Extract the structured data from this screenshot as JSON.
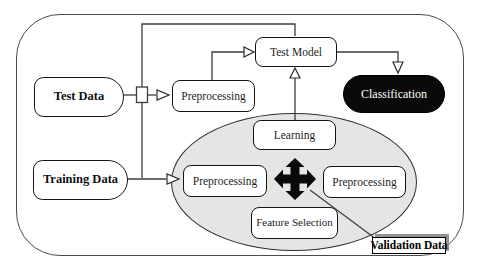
{
  "diagram": {
    "nodes": {
      "test_data": "Test Data",
      "training_data": "Training Data",
      "preprocessing_top": "Preprocessing",
      "test_model": "Test Model",
      "classification": "Classification",
      "learning": "Learning",
      "preprocessing_left": "Preprocessing",
      "preprocessing_right": "Preprocessing",
      "feature_selection": "Feature Selection",
      "validation_data": "Validation Data"
    },
    "edges": [
      {
        "from": "test_data",
        "to": "preprocessing_top",
        "arrow": "hollow-triangle"
      },
      {
        "from": "preprocessing_top",
        "to": "test_model",
        "arrow": "hollow-triangle"
      },
      {
        "from": "training_data",
        "to": "preprocessing_left",
        "arrow": "hollow-triangle"
      },
      {
        "from": "training_data_branch",
        "to": "test_model",
        "arrow": "none"
      },
      {
        "from": "test_model",
        "to": "classification",
        "arrow": "hollow-triangle"
      },
      {
        "from": "learning",
        "to": "test_model",
        "arrow": "hollow-triangle"
      },
      {
        "from": "validation_ellipse_center",
        "to": "validation_data",
        "arrow": "none"
      }
    ],
    "symbols": {
      "cross_arrow": "four-way black move arrow at center of validation ellipse",
      "line_hop": "small bridge where test-data line crosses vertical branch line"
    },
    "colors": {
      "node_fill": "#ffffff",
      "node_border": "#141414",
      "ellipse_fill": "#e5e5e5",
      "classification_fill": "#0a0a0a",
      "classification_text": "#ffffff",
      "line": "#3c3c3c",
      "validation_shadow": "#949494"
    }
  }
}
